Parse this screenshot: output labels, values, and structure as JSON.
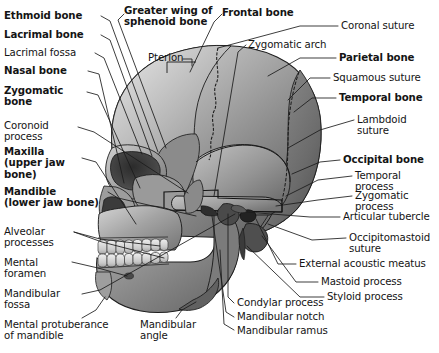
{
  "diagram": {
    "colors": {
      "background": "#ffffff",
      "text": "#141414",
      "leader_line": "#1b1b1b",
      "bone_light": "#d9d9d9",
      "bone_mid": "#a8a8a8",
      "bone_dark": "#6e6e6e",
      "bone_shadow": "#3a3a3a",
      "cavity": "#2a2a2a"
    }
  },
  "labels": {
    "left": [
      {
        "id": "ethmoid-bone",
        "text": "Ethmoid bone",
        "bold": true
      },
      {
        "id": "lacrimal-bone",
        "text": "Lacrimal bone",
        "bold": true
      },
      {
        "id": "lacrimal-fossa",
        "text": "Lacrimal fossa",
        "bold": false
      },
      {
        "id": "nasal-bone",
        "text": "Nasal bone",
        "bold": true
      },
      {
        "id": "zygomatic-bone",
        "text": "Zygomatic\nbone",
        "bold": true
      },
      {
        "id": "coronoid-process",
        "text": "Coronoid\nprocess",
        "bold": false
      },
      {
        "id": "maxilla",
        "text": "Maxilla\n(upper jaw\nbone)",
        "bold": true
      },
      {
        "id": "mandible",
        "text": "Mandible\n(lower jaw bone)",
        "bold": true
      },
      {
        "id": "alveolar-processes",
        "text": "Alveolar\nprocesses",
        "bold": false
      },
      {
        "id": "mental-foramen",
        "text": "Mental\nforamen",
        "bold": false
      },
      {
        "id": "mandibular-fossa",
        "text": "Mandibular\nfossa",
        "bold": false
      },
      {
        "id": "mental-protuberance-of-mandible",
        "text": "Mental protuberance\nof mandible",
        "bold": false
      }
    ],
    "top": [
      {
        "id": "greater-wing-of-sphenoid-bone",
        "text": "Greater wing of\nsphenoid bone",
        "bold": true
      },
      {
        "id": "frontal-bone",
        "text": "Frontal bone",
        "bold": true
      },
      {
        "id": "pterion",
        "text": "Pterion",
        "bold": false
      }
    ],
    "right": [
      {
        "id": "coronal-suture",
        "text": "Coronal suture",
        "bold": false
      },
      {
        "id": "zygomatic-arch",
        "text": "Zygomatic arch",
        "bold": false
      },
      {
        "id": "parietal-bone",
        "text": "Parietal bone",
        "bold": true
      },
      {
        "id": "squamous-suture",
        "text": "Squamous suture",
        "bold": false
      },
      {
        "id": "temporal-bone",
        "text": "Temporal bone",
        "bold": true
      },
      {
        "id": "lambdoid-suture",
        "text": "Lambdoid\nsuture",
        "bold": false
      },
      {
        "id": "occipital-bone",
        "text": "Occipital bone",
        "bold": true
      },
      {
        "id": "temporal-process",
        "text": "Temporal\nprocess",
        "bold": false
      },
      {
        "id": "zygomatic-process",
        "text": "Zygomatic\nprocess",
        "bold": false
      },
      {
        "id": "articular-tubercle",
        "text": "Articular tubercle",
        "bold": false
      },
      {
        "id": "occipitomastoid-suture",
        "text": "Occipitomastoid\nsuture",
        "bold": false
      },
      {
        "id": "external-acoustic-meatus",
        "text": "External acoustic meatus",
        "bold": false
      },
      {
        "id": "mastoid-process",
        "text": "Mastoid process",
        "bold": false
      },
      {
        "id": "styloid-process",
        "text": "Styloid process",
        "bold": false
      }
    ],
    "bottom": [
      {
        "id": "condylar-process",
        "text": "Condylar process",
        "bold": false
      },
      {
        "id": "mandibular-notch",
        "text": "Mandibular notch",
        "bold": false
      },
      {
        "id": "mandibular-ramus",
        "text": "Mandibular ramus",
        "bold": false
      },
      {
        "id": "mandibular-angle",
        "text": "Mandibular\nangle",
        "bold": false
      }
    ]
  }
}
